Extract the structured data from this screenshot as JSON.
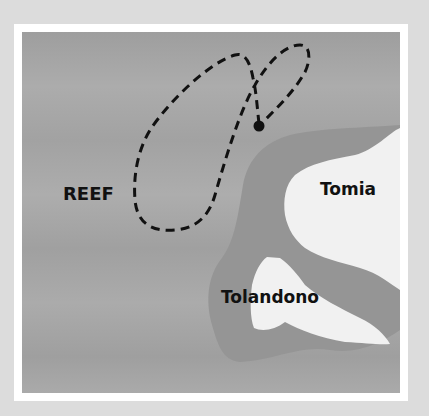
{
  "map": {
    "title": "",
    "labels": [
      {
        "id": "reef",
        "text": "REEF"
      },
      {
        "id": "tomia",
        "text": "Tomia"
      },
      {
        "id": "tolandono",
        "text": "Tolandono"
      }
    ],
    "colors": {
      "background": "#dcdcdc",
      "frame": "#ffffff",
      "sea": "#a7a7a7",
      "shallow": "#959595",
      "land": "#f1f1f1",
      "route": "#111111"
    },
    "features": {
      "route": "dashed-loop-route",
      "start_point": "dive-site-marker"
    }
  }
}
